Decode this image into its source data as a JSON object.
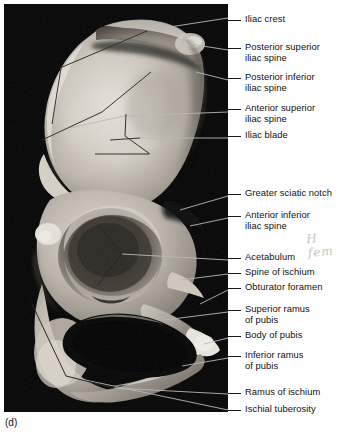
{
  "figure": {
    "panel_letter": "(d)",
    "background_color": "#050505",
    "page_background": "#ffffff",
    "label_color": "#111111",
    "leader_line_color_on_photo": "#b9b9b9",
    "leader_line_color_on_page": "#1a1a1a"
  },
  "pencil_annotation": {
    "text": "H fem",
    "color": "#c9c5c0"
  },
  "labels": [
    {
      "id": "iliac-crest",
      "text": "Iliac crest",
      "top": 14,
      "lines": 1
    },
    {
      "id": "posterior-superior-iliac-spine",
      "text": "Posterior superior\niliac spine",
      "top": 42,
      "lines": 2
    },
    {
      "id": "posterior-inferior-iliac-spine",
      "text": "Posterior inferior\niliac spine",
      "top": 72,
      "lines": 2
    },
    {
      "id": "anterior-superior-iliac-spine",
      "text": "Anterior superior\niliac spine",
      "top": 103,
      "lines": 2
    },
    {
      "id": "iliac-blade",
      "text": "Iliac blade",
      "top": 130,
      "lines": 1
    },
    {
      "id": "greater-sciatic-notch",
      "text": "Greater sciatic notch",
      "top": 188,
      "lines": 1
    },
    {
      "id": "anterior-inferior-iliac-spine",
      "text": "Anterior inferior\niliac spine",
      "top": 210,
      "lines": 2
    },
    {
      "id": "acetabulum",
      "text": "Acetabulum",
      "top": 252,
      "lines": 1
    },
    {
      "id": "spine-of-ischium",
      "text": "Spine of ischium",
      "top": 267,
      "lines": 1
    },
    {
      "id": "obturator-foramen",
      "text": "Obturator foramen",
      "top": 282,
      "lines": 1
    },
    {
      "id": "superior-ramus-of-pubis",
      "text": "Superior ramus\nof pubis",
      "top": 304,
      "lines": 2
    },
    {
      "id": "body-of-pubis",
      "text": "Body of pubis",
      "top": 330,
      "lines": 1
    },
    {
      "id": "inferior-ramus-of-pubis",
      "text": "Inferior ramus\nof pubis",
      "top": 350,
      "lines": 2
    },
    {
      "id": "ramus-of-ischium",
      "text": "Ramus of ischium",
      "top": 387,
      "lines": 1
    },
    {
      "id": "ischial-tuberosity",
      "text": "Ischial tuberosity",
      "top": 404,
      "lines": 1
    }
  ]
}
